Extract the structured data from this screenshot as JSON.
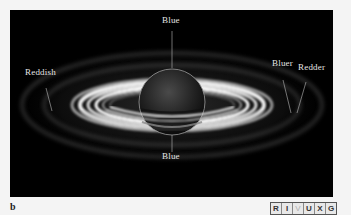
{
  "figure": {
    "panel_letter": "b",
    "labels": {
      "top_center": "Blue",
      "bottom_center": "Blue",
      "left": "Reddish",
      "right_inner": "Bluer",
      "right_outer": "Redder"
    },
    "wavelength_badge": {
      "letters": [
        "R",
        "I",
        "V",
        "U",
        "X",
        "G"
      ],
      "highlighted": "V"
    },
    "colors": {
      "background": "#000000",
      "page": "#f4f4f4",
      "label_text": "#e6e6e6"
    }
  }
}
